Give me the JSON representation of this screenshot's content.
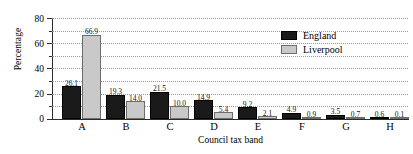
{
  "chart_data": {
    "type": "bar",
    "title": "",
    "xlabel": "Council tax band",
    "ylabel": "Percentage",
    "categories": [
      "A",
      "B",
      "C",
      "D",
      "E",
      "F",
      "G",
      "H"
    ],
    "series": [
      {
        "name": "England",
        "color": "#1a1a1a",
        "values": [
          26.1,
          19.3,
          21.5,
          14.9,
          9.2,
          4.9,
          3.5,
          0.6
        ]
      },
      {
        "name": "Liverpool",
        "color": "#c9c9c9",
        "values": [
          66.9,
          14.0,
          10.0,
          5.4,
          2.1,
          0.9,
          0.7,
          0.1
        ]
      }
    ],
    "value_labels": {
      "England": [
        "26.1",
        "19.3",
        "21.5",
        "14.9",
        "9.2",
        "4.9",
        "3.5",
        "0.6"
      ],
      "Liverpool": [
        "66.9",
        "14.0",
        "10.0",
        "5.4",
        "2.1",
        "0.9",
        "0.7",
        "0.1"
      ]
    },
    "ylim": [
      0,
      80
    ],
    "yticks": [
      0,
      20,
      40,
      60,
      80
    ],
    "ytick_labels": [
      "0",
      "20",
      "40",
      "60",
      "80"
    ],
    "yticks_minor": [
      10,
      30,
      50,
      70
    ],
    "grid": "horizontal-dotted",
    "legend_position": "top-right"
  }
}
